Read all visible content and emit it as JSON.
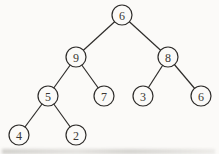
{
  "diagram": {
    "type": "binary-tree",
    "canvas": {
      "width": 219,
      "height": 154
    },
    "colors": {
      "background": "#fbfaf8",
      "node_fill": "#fbfaf8",
      "stroke": "#2e2c2a",
      "text": "#3a3733"
    },
    "node_radius": 10,
    "stroke_width": 1.2,
    "nodes": [
      {
        "id": "root",
        "label": "6",
        "x": 122,
        "y": 15
      },
      {
        "id": "left",
        "label": "9",
        "x": 76,
        "y": 57
      },
      {
        "id": "right",
        "label": "8",
        "x": 168,
        "y": 57
      },
      {
        "id": "left-left",
        "label": "5",
        "x": 48,
        "y": 96
      },
      {
        "id": "left-right",
        "label": "7",
        "x": 104,
        "y": 96
      },
      {
        "id": "right-left",
        "label": "3",
        "x": 143,
        "y": 96
      },
      {
        "id": "right-right",
        "label": "6",
        "x": 201,
        "y": 96
      },
      {
        "id": "ll-left",
        "label": "4",
        "x": 19,
        "y": 135
      },
      {
        "id": "ll-right",
        "label": "2",
        "x": 76,
        "y": 135
      }
    ],
    "edges": [
      {
        "from": "root",
        "to": "left"
      },
      {
        "from": "root",
        "to": "right"
      },
      {
        "from": "left",
        "to": "left-left"
      },
      {
        "from": "left",
        "to": "left-right"
      },
      {
        "from": "right",
        "to": "right-left"
      },
      {
        "from": "right",
        "to": "right-right"
      },
      {
        "from": "left-left",
        "to": "ll-left"
      },
      {
        "from": "left-left",
        "to": "ll-right"
      }
    ]
  }
}
